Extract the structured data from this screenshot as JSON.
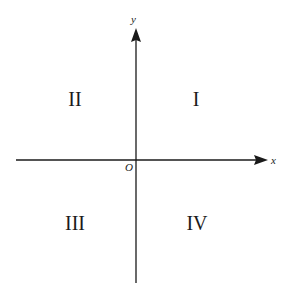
{
  "diagram": {
    "type": "coordinate-plane-quadrants",
    "axes": {
      "x_label": "x",
      "y_label": "y",
      "origin_label": "O"
    },
    "quadrants": {
      "q1": "I",
      "q2": "II",
      "q3": "III",
      "q4": "IV"
    },
    "colors": {
      "axis": "#1a1a1a",
      "text": "#1a1a1a",
      "background": "#ffffff"
    }
  }
}
